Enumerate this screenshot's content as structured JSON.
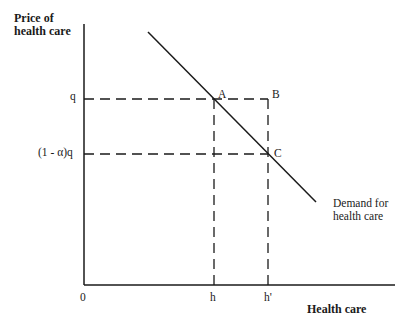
{
  "diagram": {
    "y_axis_label_line1": "Price of",
    "y_axis_label_line2": "health care",
    "x_axis_label": "Health care",
    "origin_label": "0",
    "y_ticks": {
      "q": "q",
      "reduced": "(1 - α)q"
    },
    "x_ticks": {
      "h": "h",
      "h_prime": "h'"
    },
    "points": {
      "A": "A",
      "B": "B",
      "C": "C"
    },
    "demand_label_line1": "Demand for",
    "demand_label_line2": "health care",
    "colors": {
      "line": "#1a1a1a",
      "background": "#ffffff"
    }
  }
}
